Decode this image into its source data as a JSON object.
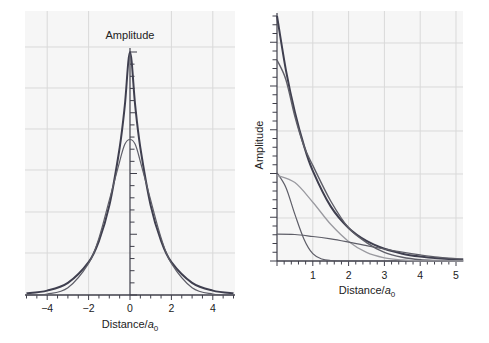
{
  "chart_data": [
    {
      "type": "line",
      "panel": "left",
      "title": "",
      "ylabel": "Amplitude",
      "xlabel": "Distance/a0",
      "xlabel_main": "Distance/",
      "xlabel_italic": "a",
      "xlabel_sub": "0",
      "xlim": [
        -5,
        5
      ],
      "ylim": [
        0,
        1.0
      ],
      "xticks": [
        "−4",
        "−2",
        "0",
        "2",
        "4"
      ],
      "xtick_values": [
        -4,
        -2,
        0,
        2,
        4
      ],
      "grid": true,
      "series": [
        {
          "name": "Slater-type orbital (exp(-|x|))",
          "style": "thick-dark",
          "x": [
            -5,
            -4,
            -3,
            -2,
            -1.5,
            -1,
            -0.5,
            -0.25,
            0,
            0.25,
            0.5,
            1,
            1.5,
            2,
            3,
            4,
            5
          ],
          "values": [
            0.007,
            0.018,
            0.05,
            0.135,
            0.223,
            0.368,
            0.607,
            0.779,
            1.0,
            0.779,
            0.607,
            0.368,
            0.223,
            0.135,
            0.05,
            0.018,
            0.007
          ]
        },
        {
          "name": "Gaussian fit (STO-3G)",
          "style": "thin-dark",
          "x": [
            -5,
            -4,
            -3,
            -2,
            -1.5,
            -1,
            -0.5,
            -0.25,
            0,
            0.25,
            0.5,
            1,
            1.5,
            2,
            3,
            4,
            5
          ],
          "values": [
            0.0,
            0.004,
            0.03,
            0.13,
            0.235,
            0.39,
            0.55,
            0.62,
            0.64,
            0.62,
            0.55,
            0.39,
            0.235,
            0.13,
            0.03,
            0.004,
            0.0
          ]
        }
      ]
    },
    {
      "type": "line",
      "panel": "right",
      "title": "",
      "ylabel": "Amplitude",
      "xlabel": "Distance/a0",
      "xlabel_main": "Distance/",
      "xlabel_italic": "a",
      "xlabel_sub": "0",
      "xlim": [
        0,
        5.2
      ],
      "ylim": [
        0,
        1.0
      ],
      "xticks": [
        "1",
        "2",
        "3",
        "4",
        "5"
      ],
      "xtick_values": [
        1,
        2,
        3,
        4,
        5
      ],
      "grid": true,
      "series": [
        {
          "name": "Slater-type orbital",
          "style": "thick-dark",
          "x": [
            0,
            0.25,
            0.5,
            0.75,
            1,
            1.5,
            2,
            2.5,
            3,
            3.5,
            4,
            4.5,
            5,
            5.2
          ],
          "values": [
            1.0,
            0.779,
            0.607,
            0.472,
            0.368,
            0.223,
            0.135,
            0.082,
            0.05,
            0.03,
            0.018,
            0.011,
            0.007,
            0.006
          ]
        },
        {
          "name": "Gaussian sum fit",
          "style": "medium-dark",
          "x": [
            0,
            0.25,
            0.5,
            0.75,
            1,
            1.5,
            2,
            2.5,
            3,
            3.5,
            4,
            4.5,
            5,
            5.2
          ],
          "values": [
            0.82,
            0.74,
            0.59,
            0.47,
            0.39,
            0.245,
            0.135,
            0.075,
            0.035,
            0.015,
            0.005,
            0.002,
            0.0,
            0.0
          ]
        },
        {
          "name": "Gaussian component 1 (tight)",
          "style": "medium",
          "x": [
            0,
            0.25,
            0.5,
            0.75,
            1,
            1.25,
            1.5,
            2,
            3,
            4,
            5,
            5.2
          ],
          "values": [
            0.36,
            0.3,
            0.19,
            0.09,
            0.03,
            0.008,
            0.002,
            0.0,
            0.0,
            0.0,
            0.0,
            0.0
          ]
        },
        {
          "name": "Gaussian component 2 (medium)",
          "style": "light",
          "x": [
            0,
            0.5,
            1,
            1.5,
            2,
            2.5,
            3,
            3.5,
            4,
            5,
            5.2
          ],
          "values": [
            0.35,
            0.32,
            0.24,
            0.15,
            0.08,
            0.035,
            0.013,
            0.004,
            0.001,
            0.0,
            0.0
          ]
        },
        {
          "name": "Gaussian component 3 (diffuse)",
          "style": "medium",
          "x": [
            0,
            0.5,
            1,
            1.5,
            2,
            2.5,
            3,
            3.5,
            4,
            4.5,
            5,
            5.2
          ],
          "values": [
            0.11,
            0.108,
            0.1,
            0.09,
            0.077,
            0.063,
            0.049,
            0.036,
            0.025,
            0.016,
            0.01,
            0.008
          ]
        }
      ]
    }
  ],
  "left_panel": {
    "ylabel": "Amplitude",
    "xlabel_main": "Distance/",
    "xlabel_italic": "a",
    "xlabel_sub": "0",
    "xticks": [
      "−4",
      "−2",
      "0",
      "2",
      "4"
    ]
  },
  "right_panel": {
    "ylabel": "Amplitude",
    "xlabel_main": "Distance/",
    "xlabel_italic": "a",
    "xlabel_sub": "0",
    "xticks": [
      "1",
      "2",
      "3",
      "4",
      "5"
    ]
  },
  "colors": {
    "background": "#ffffff",
    "plot_bg": "#f6f6f6",
    "grid": "#d9d9d9",
    "axis": "#3f3f4a",
    "thick_line": "#3f3f4f",
    "medium_line": "#5e5e68",
    "light_line": "#9a9aa0"
  }
}
